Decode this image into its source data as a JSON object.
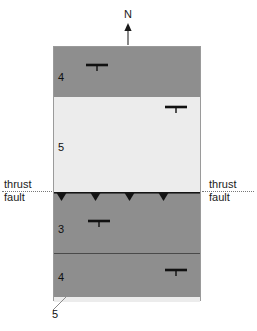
{
  "figure": {
    "type": "geologic-map-diagram",
    "orientation": {
      "north_label": "N",
      "arrow_icon": "north-arrow-icon"
    },
    "colors": {
      "unit_dark": "#8e8e8e",
      "unit_light": "#ececec",
      "outline": "#9a9a9a",
      "contact_line": "#4a4a4a",
      "fault_line": "#141414",
      "dotted_extension": "#777777",
      "text": "#101010"
    },
    "map_block": {
      "bands": [
        {
          "unit": "4",
          "fill": "dark",
          "label": "4",
          "label_x": 4,
          "label_y": 24,
          "top": 0,
          "height": 50
        },
        {
          "unit": "5",
          "fill": "light",
          "label": "5",
          "label_x": 4,
          "label_y": 44,
          "top": 50,
          "height": 95
        },
        {
          "unit": "3",
          "fill": "dark",
          "label": "3",
          "label_x": 4,
          "label_y": 30,
          "top": 146,
          "height": 60
        },
        {
          "unit": "4b",
          "fill": "dark",
          "label": "4",
          "label_x": 4,
          "label_y": 18,
          "top": 206,
          "height": 44
        },
        {
          "unit": "5b",
          "fill": "light",
          "label": "",
          "label_x": 0,
          "label_y": 0,
          "top": 250,
          "height": 5
        }
      ],
      "strike_dip_symbols": [
        {
          "id": "strike-dip-1",
          "x": 31,
          "y": 16,
          "strike_length": 22,
          "dip_tick": 6
        },
        {
          "id": "strike-dip-2",
          "x": 110,
          "y": 58,
          "strike_length": 22,
          "dip_tick": 6
        },
        {
          "id": "strike-dip-3",
          "x": 33,
          "y": 172,
          "strike_length": 22,
          "dip_tick": 6
        },
        {
          "id": "strike-dip-4",
          "x": 110,
          "y": 221,
          "strike_length": 22,
          "dip_tick": 6
        }
      ],
      "thrust_fault": {
        "top": 145,
        "teeth_count": 4,
        "teeth_x": [
          2,
          36,
          70,
          104
        ],
        "tooth_width": 11,
        "tooth_height": 9
      }
    },
    "labels": {
      "thrust_fault_left_line1": "thrust",
      "thrust_fault_left_line2": "fault",
      "thrust_fault_right_line1": "thrust",
      "thrust_fault_right_line2": "fault",
      "bottom_unit": "5"
    }
  }
}
